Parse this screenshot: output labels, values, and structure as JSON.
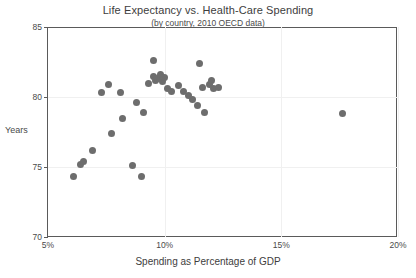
{
  "chart_data": {
    "type": "scatter",
    "title": "Life Expectancy vs. Health-Care Spending",
    "subtitle": "(by country, 2010 OECD data)",
    "xlabel": "Spending as Percentage of GDP",
    "ylabel": "Years",
    "xlim": [
      5,
      20
    ],
    "ylim": [
      70,
      85
    ],
    "xticks": [
      5,
      10,
      15,
      20
    ],
    "xtick_labels": [
      "5%",
      "10%",
      "15%",
      "20%"
    ],
    "yticks": [
      70,
      75,
      80,
      85
    ],
    "ytick_labels": [
      "70",
      "75",
      "80",
      "85"
    ],
    "grid": "faint",
    "legend": "none",
    "marker_color": "#6d6d6d",
    "marker_size_px": 7,
    "points": [
      {
        "x": 6.1,
        "y": 74.3
      },
      {
        "x": 6.4,
        "y": 75.2
      },
      {
        "x": 6.5,
        "y": 75.4
      },
      {
        "x": 6.9,
        "y": 76.2
      },
      {
        "x": 7.3,
        "y": 80.3
      },
      {
        "x": 7.6,
        "y": 80.9
      },
      {
        "x": 7.7,
        "y": 77.4
      },
      {
        "x": 8.1,
        "y": 80.3
      },
      {
        "x": 8.2,
        "y": 78.5
      },
      {
        "x": 8.6,
        "y": 75.1
      },
      {
        "x": 8.8,
        "y": 79.6
      },
      {
        "x": 9.0,
        "y": 74.3
      },
      {
        "x": 9.1,
        "y": 78.9
      },
      {
        "x": 9.3,
        "y": 81.0
      },
      {
        "x": 9.5,
        "y": 82.6
      },
      {
        "x": 9.5,
        "y": 81.5
      },
      {
        "x": 9.6,
        "y": 81.2
      },
      {
        "x": 9.7,
        "y": 81.3
      },
      {
        "x": 9.8,
        "y": 81.6
      },
      {
        "x": 9.9,
        "y": 81.1
      },
      {
        "x": 10.0,
        "y": 81.4
      },
      {
        "x": 10.1,
        "y": 80.6
      },
      {
        "x": 10.3,
        "y": 80.4
      },
      {
        "x": 10.6,
        "y": 80.8
      },
      {
        "x": 10.8,
        "y": 80.4
      },
      {
        "x": 11.0,
        "y": 80.1
      },
      {
        "x": 11.2,
        "y": 79.8
      },
      {
        "x": 11.4,
        "y": 79.4
      },
      {
        "x": 11.5,
        "y": 82.4
      },
      {
        "x": 11.6,
        "y": 80.7
      },
      {
        "x": 11.7,
        "y": 78.9
      },
      {
        "x": 11.9,
        "y": 80.9
      },
      {
        "x": 12.0,
        "y": 81.2
      },
      {
        "x": 12.1,
        "y": 80.6
      },
      {
        "x": 12.3,
        "y": 80.7
      },
      {
        "x": 17.6,
        "y": 78.8
      }
    ]
  }
}
